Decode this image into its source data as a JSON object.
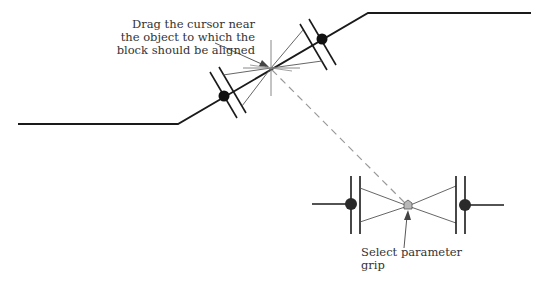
{
  "colors": {
    "line": "#1a1a1a",
    "thin_line": "#555555",
    "dashed": "#999999",
    "grip_fill": "#b8b8b8",
    "crosshair": "#888888"
  },
  "callouts": {
    "drag": {
      "lines": [
        "Drag the cursor near",
        "the object to which the",
        "block should be aligned"
      ]
    },
    "grip": {
      "lines": [
        "Select parameter",
        "grip"
      ]
    }
  },
  "diagram": {
    "upper_figure": {
      "polyline": "18,124 178,124 368,13 531,13",
      "block_left_dot": [
        224,
        96
      ],
      "block_right_dot": [
        322,
        39
      ],
      "cursor_point": [
        271,
        68
      ]
    },
    "lower_figure": {
      "left_dot": [
        351,
        204
      ],
      "right_dot": [
        465,
        205
      ],
      "grip": [
        408,
        206
      ]
    }
  }
}
